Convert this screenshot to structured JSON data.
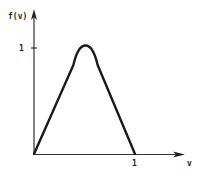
{
  "chart_data": {
    "type": "line",
    "title": "",
    "xlabel": "v",
    "ylabel": "f(v)",
    "xlim": [
      0,
      1.45
    ],
    "ylim": [
      0,
      1.35
    ],
    "grid": false,
    "legend": null,
    "x_ticks": [
      {
        "value": 1,
        "label": "1"
      }
    ],
    "y_ticks": [
      {
        "value": 1,
        "label": "1"
      }
    ],
    "series": [
      {
        "name": "f(v)",
        "x": [
          0,
          0.39,
          0.43,
          0.47,
          0.51,
          0.55,
          0.59,
          0.63,
          1.0
        ],
        "y": [
          0,
          0.84,
          0.92,
          0.98,
          1.0,
          0.98,
          0.92,
          0.84,
          0
        ]
      }
    ]
  },
  "labels": {
    "y_axis": "f(v)",
    "x_axis": "v",
    "y_tick_1": "1",
    "x_tick_1": "1"
  },
  "colors": {
    "stroke": "#1a1a1a",
    "axis": "#333333",
    "background": "#ffffff"
  }
}
